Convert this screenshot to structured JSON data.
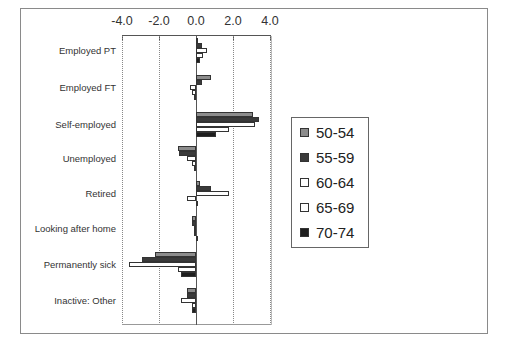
{
  "chart_data": {
    "type": "bar",
    "orientation": "horizontal",
    "title": "",
    "xlabel": "",
    "ylabel": "",
    "xlim": [
      -4.0,
      4.0
    ],
    "x_ticks": [
      "-4.0",
      "-2.0",
      "0.0",
      "2.0",
      "4.0"
    ],
    "grid": "vertical dotted",
    "legend_position": "right",
    "categories": [
      "Employed PT",
      "Employed FT",
      "Self-employed",
      "Unemployed",
      "Retired",
      "Looking after home",
      "Permanently sick",
      "Inactive: Other"
    ],
    "series": [
      {
        "name": "50-54",
        "color": "#8c8c8c",
        "values": [
          0.05,
          0.8,
          3.1,
          -1.0,
          0.2,
          -0.2,
          -2.2,
          -0.5
        ]
      },
      {
        "name": "55-59",
        "color": "#3a3a3a",
        "values": [
          0.3,
          0.3,
          3.4,
          -0.9,
          0.8,
          -0.2,
          -2.9,
          -0.5
        ]
      },
      {
        "name": "60-64",
        "color": "#ffffff",
        "values": [
          0.6,
          -0.3,
          3.2,
          -0.5,
          1.8,
          -0.1,
          -3.6,
          -0.8
        ]
      },
      {
        "name": "65-69",
        "color": "#ffffff",
        "values": [
          0.4,
          -0.2,
          1.8,
          -0.2,
          -0.5,
          -0.1,
          -1.0,
          -0.2
        ]
      },
      {
        "name": "70-74",
        "color": "#1e1e1e",
        "values": [
          0.2,
          -0.1,
          1.1,
          -0.1,
          0.0,
          0.0,
          -0.8,
          -0.2
        ]
      }
    ]
  }
}
